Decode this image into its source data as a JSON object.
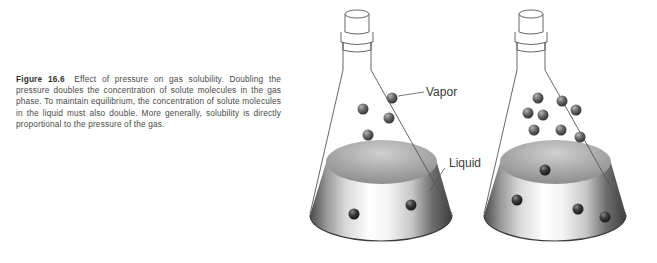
{
  "caption": {
    "figure_number": "Figure 16.6",
    "text": "Effect of pressure on gas solubility. Doubling the pressure doubles the concentration of solute molecules in the gas phase. To maintain equilibrium, the concentration of solute molecules in the liquid must also double. More generally, solubility is directly proportional to the pressure of the gas."
  },
  "labels": {
    "vapor": "Vapor",
    "liquid": "Liquid"
  },
  "flasks": [
    {
      "name": "low-pressure-flask",
      "offset_x": 0,
      "gas_molecules": [
        [
          363,
          109
        ],
        [
          392,
          98
        ],
        [
          389,
          118
        ],
        [
          368,
          135
        ]
      ],
      "liquid_molecules": [
        [
          354,
          214
        ],
        [
          411,
          205
        ]
      ]
    },
    {
      "name": "high-pressure-flask",
      "offset_x": 174,
      "gas_molecules": [
        [
          538,
          98
        ],
        [
          562,
          101
        ],
        [
          576,
          110
        ],
        [
          528,
          113
        ],
        [
          543,
          115
        ],
        [
          534,
          130
        ],
        [
          561,
          130
        ],
        [
          580,
          137
        ]
      ],
      "liquid_molecules": [
        [
          545,
          170
        ],
        [
          517,
          200
        ],
        [
          578,
          209
        ],
        [
          605,
          217
        ]
      ]
    }
  ],
  "colors": {
    "outline": "#555555",
    "molecule": "#5a5a5a",
    "liquid_surface": "#9a9a9a",
    "caption_text": "#4a4a4a"
  }
}
